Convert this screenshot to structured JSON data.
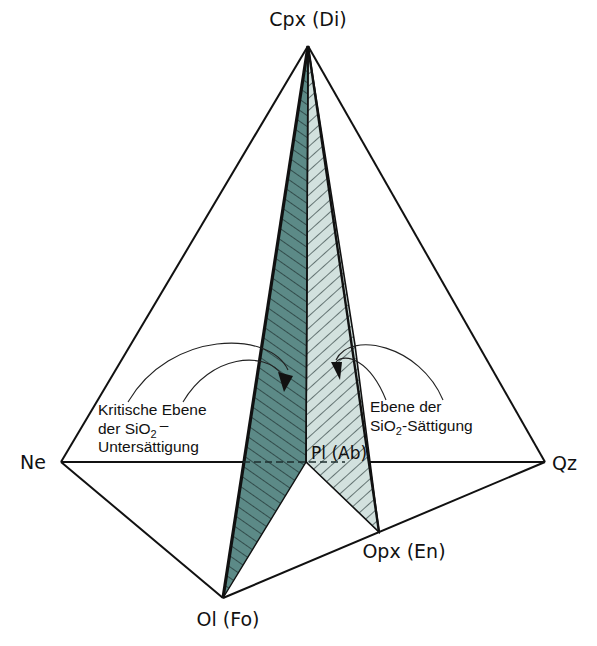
{
  "figure": {
    "type": "tetrahedron-phase-diagram",
    "vertices": {
      "top": "Cpx (Di)",
      "left": "Ne",
      "right": "Qz",
      "front": "Ol (Fo)",
      "front_right": "Opx (En)",
      "base_point": "Pl (Ab)"
    },
    "planes": [
      {
        "name": "critical-plane",
        "label_lines": [
          "Kritische Ebene",
          "der SiO",
          "2",
          "–",
          "Untersättigung"
        ],
        "corners": [
          "Cpx (Di)",
          "Ol (Fo)",
          "Pl (Ab)"
        ],
        "fill": "#5c8a87",
        "hatch": "#1a2a2a"
      },
      {
        "name": "saturation-plane",
        "label_lines": [
          "Ebene der",
          "SiO",
          "2",
          "-Sättigung"
        ],
        "corners": [
          "Cpx (Di)",
          "Pl (Ab)",
          "Opx (En)"
        ],
        "fill": "#d2e1de",
        "hatch": "#1a2a2a"
      }
    ],
    "colors": {
      "edge": "#111111",
      "background": "#ffffff"
    }
  }
}
